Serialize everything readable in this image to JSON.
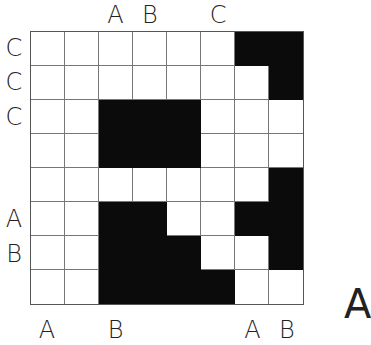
{
  "puzzle": {
    "rows": 8,
    "cols": 8,
    "filled": [
      [
        7,
        8
      ],
      [
        8
      ],
      [
        3,
        4,
        5
      ],
      [
        3,
        4,
        5
      ],
      [
        8
      ],
      [
        3,
        4,
        7,
        8
      ],
      [
        3,
        4,
        5,
        8
      ],
      [
        3,
        4,
        5,
        6
      ]
    ]
  },
  "labels": {
    "top": [
      {
        "col": 3,
        "text": "A"
      },
      {
        "col": 4,
        "text": "B"
      },
      {
        "col": 6,
        "text": "C"
      }
    ],
    "bottom": [
      {
        "col": 1,
        "text": "A"
      },
      {
        "col": 3,
        "text": "B"
      },
      {
        "col": 7,
        "text": "A"
      },
      {
        "col": 8,
        "text": "B"
      }
    ],
    "left": [
      {
        "row": 1,
        "text": "C"
      },
      {
        "row": 2,
        "text": "C"
      },
      {
        "row": 3,
        "text": "C"
      },
      {
        "row": 6,
        "text": "A"
      },
      {
        "row": 7,
        "text": "B"
      }
    ]
  },
  "clipped_label": "A"
}
